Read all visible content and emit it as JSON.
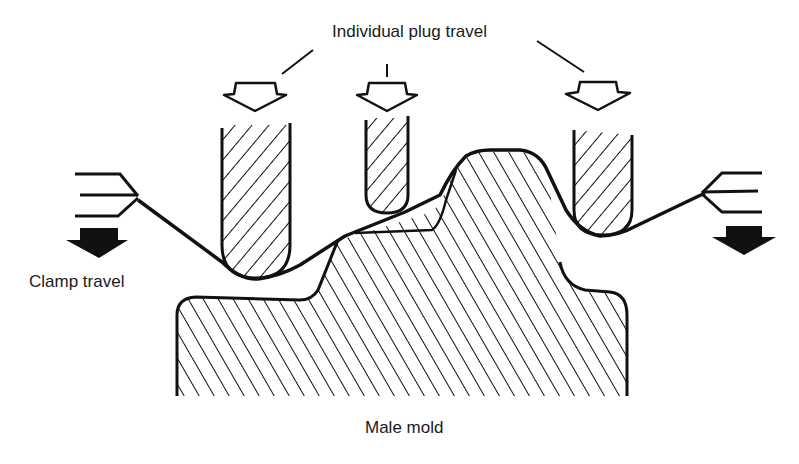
{
  "diagram": {
    "type": "plug-assist thermoforming schematic",
    "labels": {
      "plug_travel": "Individual plug travel",
      "clamp_travel": "Clamp travel",
      "mold": "Male mold"
    },
    "components": [
      {
        "id": "left-plug",
        "kind": "plug",
        "fill": "hatched"
      },
      {
        "id": "middle-plug",
        "kind": "plug",
        "fill": "hatched"
      },
      {
        "id": "right-plug",
        "kind": "plug",
        "fill": "hatched"
      },
      {
        "id": "male-mold",
        "kind": "mold",
        "fill": "hatched"
      },
      {
        "id": "plastic-sheet",
        "kind": "sheet"
      },
      {
        "id": "left-clamp",
        "kind": "clamp"
      },
      {
        "id": "right-clamp",
        "kind": "clamp"
      }
    ],
    "arrows": [
      {
        "id": "left-plug-arrow",
        "style": "hollow",
        "direction": "down"
      },
      {
        "id": "middle-plug-arrow",
        "style": "hollow",
        "direction": "down"
      },
      {
        "id": "right-plug-arrow",
        "style": "hollow",
        "direction": "down"
      },
      {
        "id": "left-clamp-arrow",
        "style": "solid",
        "direction": "down"
      },
      {
        "id": "right-clamp-arrow",
        "style": "solid",
        "direction": "down"
      }
    ],
    "colors": {
      "ink": "#111111",
      "background": "#ffffff"
    }
  }
}
